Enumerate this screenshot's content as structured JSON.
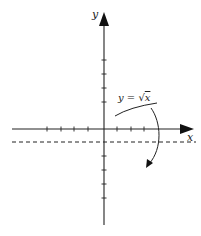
{
  "diagram": {
    "type": "axes-rotation",
    "axes": {
      "x_label": "x",
      "y_label": "y",
      "x_axis_y": 129,
      "y_axis_x": 104,
      "x_ticks_left": [
        47,
        61,
        74,
        88
      ],
      "x_ticks_right": [
        117,
        131,
        144
      ],
      "y_ticks_above": [
        60,
        74,
        88,
        102
      ],
      "y_ticks_below": [
        156,
        170,
        184,
        198
      ]
    },
    "curve": {
      "label": "y = √x",
      "label_prefix": "y = ",
      "label_radical": "√",
      "label_var": "x"
    },
    "axis_of_rotation": {
      "style": "dashed",
      "y": 142
    },
    "rotation_arrow": {
      "direction": "clockwise-down"
    },
    "colors": {
      "stroke": "#222222",
      "background": "#ffffff"
    }
  }
}
